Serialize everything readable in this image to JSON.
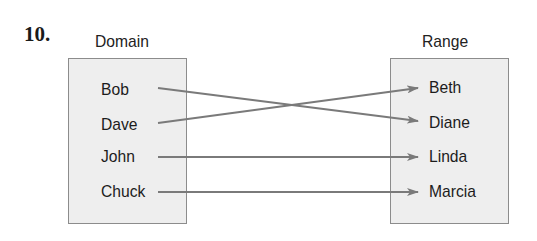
{
  "problem_number": "10.",
  "domain": {
    "title": "Domain",
    "items": [
      "Bob",
      "Dave",
      "John",
      "Chuck"
    ]
  },
  "range": {
    "title": "Range",
    "items": [
      "Beth",
      "Diane",
      "Linda",
      "Marcia"
    ]
  },
  "mapping": [
    {
      "from": "Bob",
      "to": "Diane"
    },
    {
      "from": "Dave",
      "to": "Beth"
    },
    {
      "from": "John",
      "to": "Linda"
    },
    {
      "from": "Chuck",
      "to": "Marcia"
    }
  ],
  "colors": {
    "box_fill": "#eeeeee",
    "box_border": "#8c8c8c",
    "arrow": "#7a7a7a",
    "text": "#1c1c1c"
  }
}
